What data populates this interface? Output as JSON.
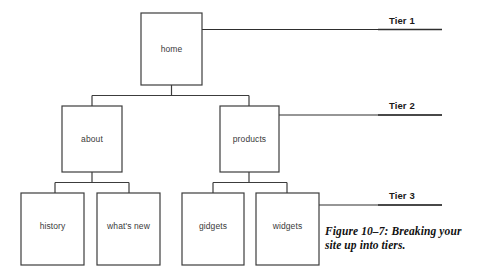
{
  "figure": {
    "caption_line_1": "Figure 10–7: Breaking your",
    "caption_line_2": "site up into tiers.",
    "caption_full": "Figure 10–7: Breaking your site up into tiers.",
    "background_color": "#ffffff",
    "line_color": "#3c3c3c",
    "box_fill_color": "#ffffff",
    "node_text_color": "#3a3a3a",
    "tier_label_color": "#1a1a1a"
  },
  "diagram": {
    "type": "tree",
    "orientation": "top-down",
    "nodes": {
      "home": {
        "label": "home",
        "tier": 1
      },
      "about": {
        "label": "about",
        "tier": 2
      },
      "products": {
        "label": "products",
        "tier": 2
      },
      "history": {
        "label": "history",
        "tier": 3
      },
      "whats_new": {
        "label": "what's new",
        "tier": 3
      },
      "gidgets": {
        "label": "gidgets",
        "tier": 3
      },
      "widgets": {
        "label": "widgets",
        "tier": 3
      }
    },
    "edges": [
      {
        "from": "home",
        "to": "about"
      },
      {
        "from": "home",
        "to": "products"
      },
      {
        "from": "about",
        "to": "history"
      },
      {
        "from": "about",
        "to": "whats_new"
      },
      {
        "from": "products",
        "to": "gidgets"
      },
      {
        "from": "products",
        "to": "widgets"
      }
    ]
  },
  "tiers": {
    "tier_1": {
      "label": "Tier 1",
      "points_to": "home"
    },
    "tier_2": {
      "label": "Tier 2",
      "points_to": "products"
    },
    "tier_3": {
      "label": "Tier 3",
      "points_to": "widgets"
    }
  }
}
